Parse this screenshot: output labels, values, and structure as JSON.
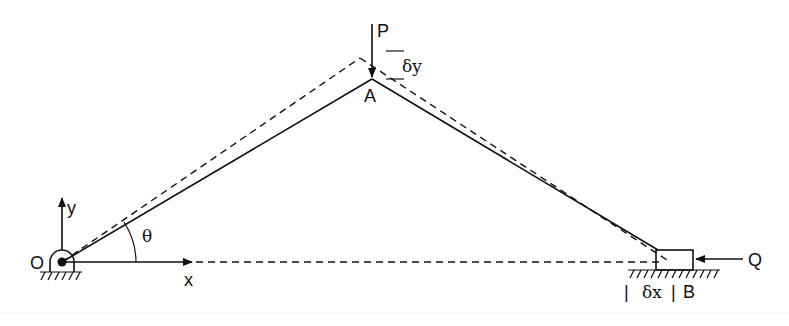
{
  "diagram": {
    "labels": {
      "origin": "O",
      "y_axis": "y",
      "x_axis": "x",
      "angle": "θ",
      "joint": "A",
      "load_p": "P",
      "delta_y": "δy",
      "slider": "B",
      "load_q": "Q",
      "delta_x": "δx",
      "bar_left": "|",
      "bar_right": "|"
    },
    "colors": {
      "stroke": "#111111",
      "background": "#ffffff"
    }
  }
}
